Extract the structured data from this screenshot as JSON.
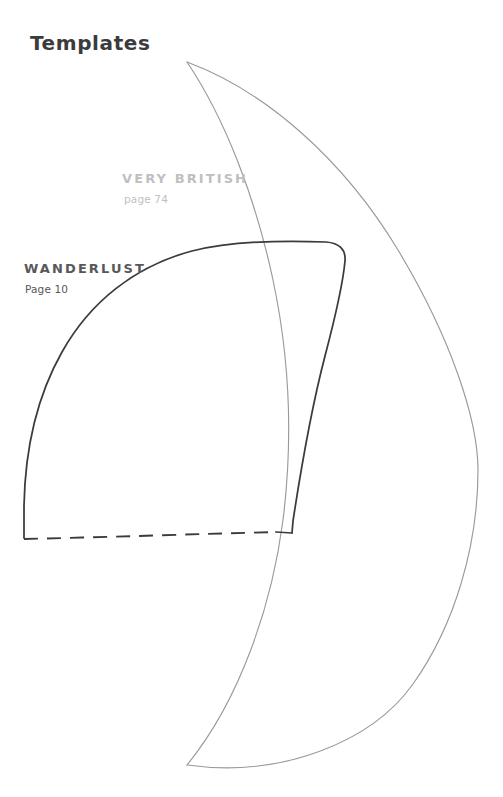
{
  "page": {
    "title": "Templates",
    "background_color": "#ffffff",
    "width": 503,
    "height": 797
  },
  "labels": [
    {
      "id": "very-british",
      "name": "VERY BRITISH",
      "page": "page 74",
      "color": "#bfbfbf"
    },
    {
      "id": "wanderlust",
      "name": "WANDERLUST",
      "page": "Page 10",
      "color": "#58585a"
    }
  ],
  "pattern_pieces": [
    {
      "id": "very-british-piece",
      "name": "VERY BRITISH",
      "stroke_color": "#9a9a9a",
      "stroke_width": 1.1,
      "line_style": "solid",
      "shape": "tall-crescent",
      "outline_path": "M 187 62 C 300 95 400 210 452 340 C 487 430 480 570 420 665 C 360 760 250 790 187 765 C 250 700 292 560 292 400 C 292 240 250 130 187 62 Z"
    },
    {
      "id": "wanderlust-piece",
      "name": "WANDERLUST",
      "stroke_color": "#3b3b3d",
      "stroke_width": 1.7,
      "line_style": "solid-with-dashed-hem",
      "shape": "quarter-arc-sleeve",
      "outline_path": "M 24 538 L 24 505 C 25 430 45 355 88 300 C 130 248 215 237 290 241 L 330 242 C 343 243 347 252 346 262 L 340 290 C 330 340 310 430 292 520 L 292 533 L 276 532",
      "hem_path": "M 24 539 L 276 532"
    }
  ],
  "icons": {
    "dashed_hem": "dashed-line-icon",
    "pattern_outline": "pattern-outline-icon"
  }
}
